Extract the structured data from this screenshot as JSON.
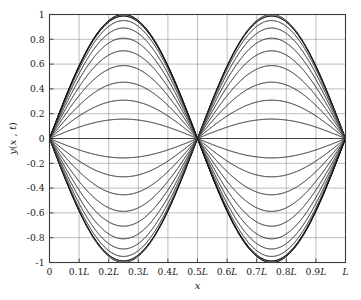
{
  "figure": {
    "background_color": "#ffffff",
    "frame_color": "#3a3a3a",
    "grid_color": "#8e8e8e",
    "curve_color": "#3a3a3a",
    "envelope_color": "#111111"
  },
  "chart_data": {
    "type": "line",
    "title": "",
    "subtitle": "",
    "xlabel": "x",
    "ylabel": "y(x, t)",
    "xlim": [
      0,
      1
    ],
    "ylim": [
      -1,
      1
    ],
    "grid": true,
    "legend": null,
    "legend_position": "none",
    "xtick_values": [
      0,
      0.1,
      0.2,
      0.3,
      0.4,
      0.5,
      0.6,
      0.7,
      0.8,
      0.9,
      1.0
    ],
    "xtick_labels": [
      "0",
      "0.1L",
      "0.2L",
      "0.3L",
      "0.4L",
      "0.5L",
      "0.6L",
      "0.7L",
      "0.8L",
      "0.9L",
      "L"
    ],
    "ytick_values": [
      1,
      0.8,
      0.6,
      0.4,
      0.2,
      0,
      -0.2,
      -0.4,
      -0.6,
      -0.8,
      -1
    ],
    "ytick_labels": [
      "1",
      "0.8",
      "0.6",
      "0.4",
      "0.2",
      "0",
      "-0.2",
      "-0.4",
      "-0.6",
      "-0.8",
      "-1"
    ],
    "spatial_mode": "sin(2*pi*x/L)",
    "harmonic_number": 2,
    "nodes": [
      0,
      0.5,
      1.0
    ],
    "antinodes": [
      0.25,
      0.75
    ],
    "antinode_values": [
      1,
      -1
    ],
    "amplitude": 1,
    "num_snapshots": 41,
    "amplitude_factors": [
      1.0,
      0.98769,
      0.95106,
      0.89101,
      0.80902,
      0.70711,
      0.58779,
      0.45399,
      0.30902,
      0.15643,
      0.0,
      -0.15643,
      -0.30902,
      -0.45399,
      -0.58779,
      -0.70711,
      -0.80902,
      -0.89101,
      -0.95106,
      -0.98769,
      -1.0,
      -0.98769,
      -0.95106,
      -0.89101,
      -0.80902,
      -0.70711,
      -0.58779,
      -0.45399,
      -0.30902,
      -0.15643,
      0.0,
      0.15643,
      0.30902,
      0.45399,
      0.58779,
      0.70711,
      0.80902,
      0.89101,
      0.95106,
      0.98769,
      1.0
    ],
    "series": [
      {
        "name": "t = 0",
        "phase_factor": 1.0,
        "peak_y": 1.0
      },
      {
        "name": "t = T/40",
        "phase_factor": 0.98769,
        "peak_y": 0.98769
      },
      {
        "name": "t = T/20",
        "phase_factor": 0.95106,
        "peak_y": 0.95106
      },
      {
        "name": "t = 3T/40",
        "phase_factor": 0.89101,
        "peak_y": 0.89101
      },
      {
        "name": "t = T/10",
        "phase_factor": 0.80902,
        "peak_y": 0.80902
      },
      {
        "name": "t = T/8",
        "phase_factor": 0.70711,
        "peak_y": 0.70711
      },
      {
        "name": "t = 3T/20",
        "phase_factor": 0.58779,
        "peak_y": 0.58779
      },
      {
        "name": "t = 7T/40",
        "phase_factor": 0.45399,
        "peak_y": 0.45399
      },
      {
        "name": "t = T/5",
        "phase_factor": 0.30902,
        "peak_y": 0.30902
      },
      {
        "name": "t = 9T/40",
        "phase_factor": 0.15643,
        "peak_y": 0.15643
      },
      {
        "name": "t = T/4",
        "phase_factor": 0.0,
        "peak_y": 0.0
      },
      {
        "name": "t = 11T/40",
        "phase_factor": -0.15643,
        "peak_y": -0.15643
      },
      {
        "name": "t = 3T/10",
        "phase_factor": -0.30902,
        "peak_y": -0.30902
      },
      {
        "name": "t = 13T/40",
        "phase_factor": -0.45399,
        "peak_y": -0.45399
      },
      {
        "name": "t = 7T/20",
        "phase_factor": -0.58779,
        "peak_y": -0.58779
      },
      {
        "name": "t = 3T/8",
        "phase_factor": -0.70711,
        "peak_y": -0.70711
      },
      {
        "name": "t = 2T/5",
        "phase_factor": -0.80902,
        "peak_y": -0.80902
      },
      {
        "name": "t = 17T/40",
        "phase_factor": -0.89101,
        "peak_y": -0.89101
      },
      {
        "name": "t = 9T/20",
        "phase_factor": -0.95106,
        "peak_y": -0.95106
      },
      {
        "name": "t = 19T/40",
        "phase_factor": -0.98769,
        "peak_y": -0.98769
      },
      {
        "name": "t = T/2",
        "phase_factor": -1.0,
        "peak_y": -1.0
      }
    ]
  }
}
